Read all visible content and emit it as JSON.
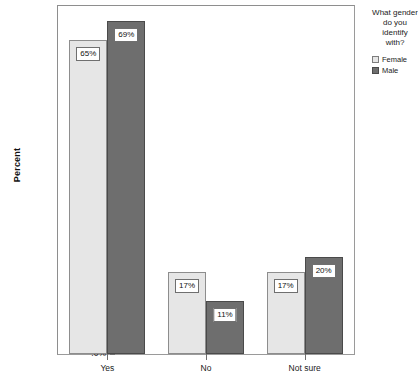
{
  "chart_data": {
    "type": "bar",
    "title": "",
    "subtitle": "",
    "xlabel": "",
    "ylabel": "Percent",
    "categories": [
      "Yes",
      "No",
      "Not sure"
    ],
    "series": [
      {
        "name": "Female",
        "values": [
          65,
          17,
          17
        ],
        "labels": [
          "65%",
          "17%",
          "17%"
        ],
        "color": "#e6e6e6"
      },
      {
        "name": "Male",
        "values": [
          69,
          11,
          20
        ],
        "labels": [
          "69%",
          "11%",
          "20%"
        ],
        "color": "#6e6e6e"
      }
    ],
    "ylim": [
      0,
      72
    ],
    "yticks": [
      0,
      20,
      40,
      60
    ],
    "ytick_labels": [
      ".0%",
      "20.0%",
      "40.0%",
      "60.0%"
    ],
    "grid": false,
    "legend_position": "right",
    "legend_title": "What gender do you identify with?",
    "data_labels_shown": true
  },
  "axes": {
    "y_title": "Percent"
  },
  "legend": {
    "title": "What gender do you identify with?",
    "items": [
      {
        "label": "Female",
        "swatch": "female"
      },
      {
        "label": "Male",
        "swatch": "male"
      }
    ]
  }
}
